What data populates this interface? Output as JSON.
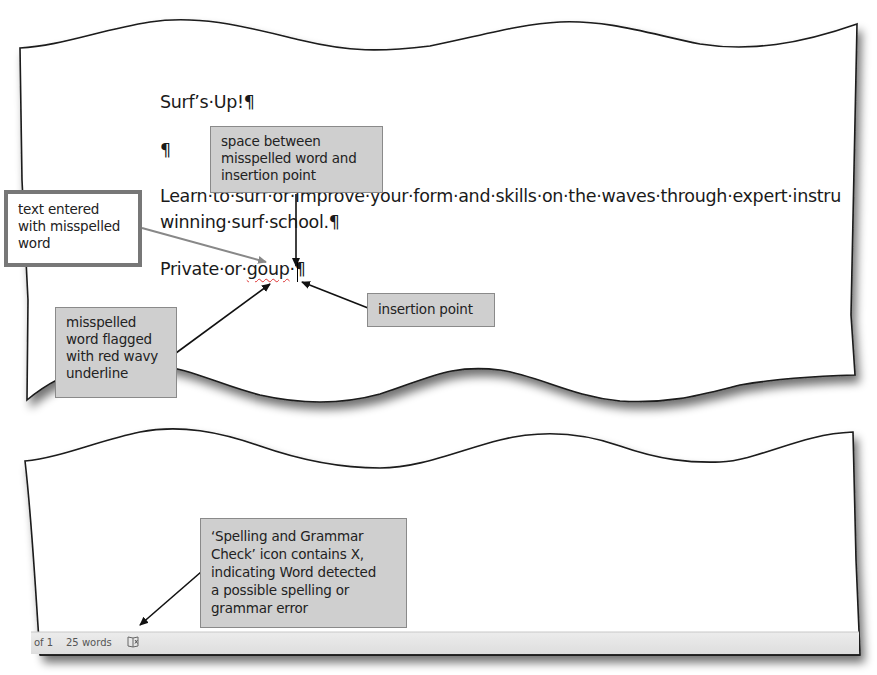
{
  "document": {
    "title_line": "Surf’s·Up!¶",
    "empty_paragraph": "¶",
    "body_line1_visible": "Learn·to·surf·or·improve·your·form·and·skills·on·the·waves·through·expert·instru",
    "body_line2": "winning·surf·school.¶",
    "private_prefix": "Private·or·",
    "misspelled_word": "goup",
    "private_suffix": "·¶"
  },
  "callouts": {
    "space_between": [
      "space between",
      "misspelled word and",
      "insertion point"
    ],
    "text_entered": [
      "text entered",
      "with misspelled",
      "word"
    ],
    "insertion_point": [
      "insertion point"
    ],
    "flagged": [
      "misspelled",
      "word flagged",
      "with red wavy",
      "underline"
    ],
    "spelling_icon": [
      "‘Spelling and Grammar",
      "Check’ icon contains X,",
      "indicating Word detected",
      "a possible spelling or",
      "grammar error"
    ]
  },
  "status_bar": {
    "page_info": "of 1",
    "word_count": "25 words",
    "proofing_icon": "spelling-grammar-error-icon"
  },
  "colors": {
    "callout_fill": "#cfcfcf",
    "status_bar": "#e6e6e6",
    "squiggle": "#d33333"
  }
}
